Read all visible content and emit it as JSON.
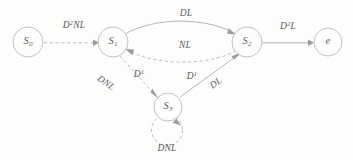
{
  "figure": {
    "type": "state-transition-diagram",
    "background_color": "#fdfdfc",
    "stroke_color": "#aaaaaa",
    "text_color": "#5a5a5a"
  },
  "nodes": [
    {
      "id": "S0",
      "label_main": "S",
      "label_sub": "0",
      "cx": 28,
      "cy": 42,
      "r": 15
    },
    {
      "id": "S1",
      "label_main": "S",
      "label_sub": "1",
      "cx": 113,
      "cy": 42,
      "r": 15
    },
    {
      "id": "S2",
      "label_main": "S",
      "label_sub": "2",
      "cx": 247,
      "cy": 42,
      "r": 15
    },
    {
      "id": "e",
      "label_main": "e",
      "label_sub": "",
      "cx": 328,
      "cy": 42,
      "r": 14
    },
    {
      "id": "S3",
      "label_main": "S",
      "label_sub": "3",
      "cx": 168,
      "cy": 107,
      "r": 14
    }
  ],
  "edges": [
    {
      "id": "e-s0-s1",
      "from": "S0",
      "to": "S1",
      "style": "dashed",
      "shape": "straight",
      "label_main": "D",
      "label_sup": "2",
      "label_tail": "NL",
      "label_x": 74,
      "label_y": 25,
      "rotation": "none"
    },
    {
      "id": "e-s1-s2-top",
      "from": "S1",
      "to": "S2",
      "style": "solid",
      "shape": "curve-up",
      "label_main": "",
      "label_sup": "",
      "label_tail": "DL",
      "label_x": 186,
      "label_y": 13,
      "rotation": "none"
    },
    {
      "id": "e-s2-s1-bottom",
      "from": "S2",
      "to": "S1",
      "style": "dashed",
      "shape": "curve-down",
      "label_main": "",
      "label_sup": "",
      "label_tail": "NL",
      "label_x": 185,
      "label_y": 45,
      "rotation": "none"
    },
    {
      "id": "e-s2-e",
      "from": "S2",
      "to": "e",
      "style": "solid",
      "shape": "straight",
      "label_main": "D",
      "label_sup": "2",
      "label_tail": "L",
      "label_x": 288,
      "label_y": 26,
      "rotation": "none"
    },
    {
      "id": "e-s1-s3-dnl",
      "from": "S1",
      "to": "S3",
      "style": "dashed",
      "shape": "straight",
      "label_main": "",
      "label_sup": "",
      "label_tail": "DNL",
      "label_x": 106,
      "label_y": 83,
      "rotation": "down"
    },
    {
      "id": "e-s1-s3-d1",
      "from": "S1",
      "to": "S3",
      "style": "dashed",
      "shape": "straight",
      "label_main": "D",
      "label_sup": "1",
      "label_tail": "",
      "label_x": 139,
      "label_y": 74,
      "rotation": "none"
    },
    {
      "id": "e-s3-s2-d1",
      "from": "S3",
      "to": "S2",
      "style": "solid",
      "shape": "straight",
      "label_main": "D",
      "label_sup": "1",
      "label_tail": "",
      "label_x": 192,
      "label_y": 76,
      "rotation": "none"
    },
    {
      "id": "e-s3-s2-dl",
      "from": "S3",
      "to": "S2",
      "style": "solid",
      "shape": "straight",
      "label_main": "",
      "label_sup": "",
      "label_tail": "DL",
      "label_x": 216,
      "label_y": 83,
      "rotation": "none"
    },
    {
      "id": "e-s3-self",
      "from": "S3",
      "to": "S3",
      "style": "dashed",
      "shape": "self-loop",
      "label_main": "",
      "label_sup": "",
      "label_tail": "DNL",
      "label_x": 167,
      "label_y": 148,
      "rotation": "none"
    }
  ]
}
